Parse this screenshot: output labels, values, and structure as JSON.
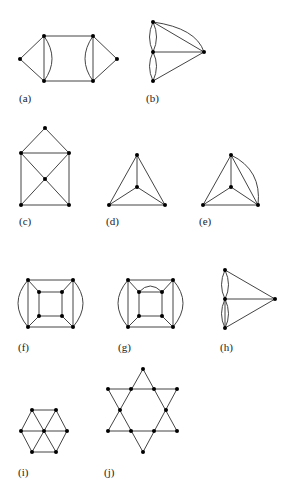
{
  "figure": {
    "graphs": [
      {
        "id": "a",
        "label": "(a)"
      },
      {
        "id": "b",
        "label": "(b)"
      },
      {
        "id": "c",
        "label": "(c)"
      },
      {
        "id": "d",
        "label": "(d)"
      },
      {
        "id": "e",
        "label": "(e)"
      },
      {
        "id": "f",
        "label": "(f)"
      },
      {
        "id": "g",
        "label": "(g)"
      },
      {
        "id": "h",
        "label": "(h)"
      },
      {
        "id": "i",
        "label": "(i)"
      },
      {
        "id": "j",
        "label": "(j)"
      }
    ],
    "colors": {
      "edge": "#444444",
      "vertex": "#000000",
      "background": "#ffffff"
    }
  }
}
